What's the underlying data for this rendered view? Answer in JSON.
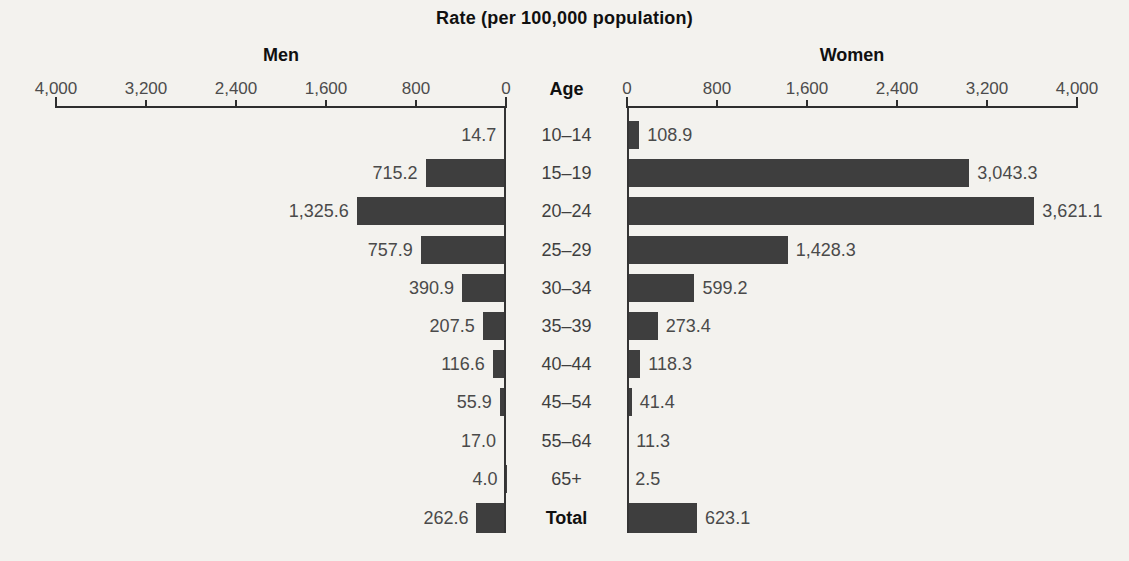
{
  "chart_data": {
    "type": "bar",
    "variant": "bilateral-pyramid",
    "title": "Rate (per 100,000 population)",
    "left_header": "Men",
    "right_header": "Women",
    "center_header": "Age",
    "axis_max": 4000,
    "axis_ticks_left": [
      "4,000",
      "3,200",
      "2,400",
      "1,600",
      "800",
      "0"
    ],
    "axis_ticks_right": [
      "0",
      "800",
      "1,600",
      "2,400",
      "3,200",
      "4,000"
    ],
    "grid": false,
    "legend": "none",
    "categories": [
      "10–14",
      "15–19",
      "20–24",
      "25–29",
      "30–34",
      "35–39",
      "40–44",
      "45–54",
      "55–64",
      "65+",
      "Total"
    ],
    "series": [
      {
        "name": "Men",
        "values": [
          14.7,
          715.2,
          1325.6,
          757.9,
          390.9,
          207.5,
          116.6,
          55.9,
          17.0,
          4.0,
          262.6
        ],
        "labels": [
          "14.7",
          "715.2",
          "1,325.6",
          "757.9",
          "390.9",
          "207.5",
          "116.6",
          "55.9",
          "17.0",
          "4.0",
          "262.6"
        ]
      },
      {
        "name": "Women",
        "values": [
          108.9,
          3043.3,
          3621.1,
          1428.3,
          599.2,
          273.4,
          118.3,
          41.4,
          11.3,
          2.5,
          623.1
        ],
        "labels": [
          "108.9",
          "3,043.3",
          "3,621.1",
          "1,428.3",
          "599.2",
          "273.4",
          "118.3",
          "41.4",
          "11.3",
          "2.5",
          "623.1"
        ]
      }
    ],
    "bar_color": "#3e3e3e",
    "label_color": "#4a4a4a",
    "header_color": "#101010",
    "background_color": "#f3f2ee"
  }
}
